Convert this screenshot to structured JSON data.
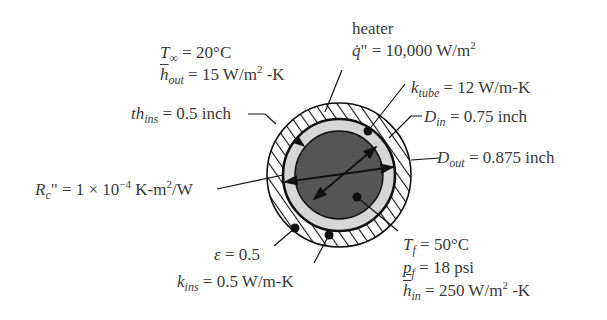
{
  "diagram": {
    "type": "cross-section",
    "colors": {
      "core": "#555555",
      "tube_wall": "#d6d6d6",
      "insulation": "#ffffff",
      "lines": "#111111",
      "text": "#3a3a3a"
    }
  },
  "labels": {
    "t_inf": {
      "sym": "T",
      "sub": "∞",
      "eq": " = 20°C"
    },
    "h_out": {
      "sym": "h",
      "sub": "out",
      "eq": " = 15 W/m",
      "sup": "2",
      "tail": " -K"
    },
    "heater": {
      "text": "heater"
    },
    "q_flux": {
      "sym": "q̇",
      "mark": "\"",
      "eq": " = 10,000 W/m",
      "sup": "2"
    },
    "k_tube": {
      "sym": "k",
      "sub": "tube",
      "eq": " = 12 W/m-K"
    },
    "d_in": {
      "sym": "D",
      "sub": "in",
      "eq": " = 0.75 inch"
    },
    "d_out": {
      "sym": "D",
      "sub": "out",
      "eq": " = 0.875 inch"
    },
    "th_ins": {
      "sym": "th",
      "sub": "ins",
      "eq": " = 0.5 inch"
    },
    "r_c": {
      "sym": "R",
      "sub": "c",
      "mark": "\"",
      "eq": " = 1 × 10",
      "sup": "−4",
      "tail": " K-m",
      "sup2": "2",
      "tail2": "/W"
    },
    "epsilon": {
      "sym": "ε",
      "eq": " = 0.5"
    },
    "k_ins": {
      "sym": "k",
      "sub": "ins",
      "eq": " = 0.5 W/m-K"
    },
    "t_f": {
      "sym": "T",
      "sub": "f",
      "eq": " = 50°C"
    },
    "p_f": {
      "sym": "p",
      "sub": "f",
      "eq": " = 18 psi"
    },
    "h_in": {
      "sym": "h",
      "sub": "in",
      "eq": " = 250 W/m",
      "sup": "2",
      "tail": " -K"
    }
  }
}
